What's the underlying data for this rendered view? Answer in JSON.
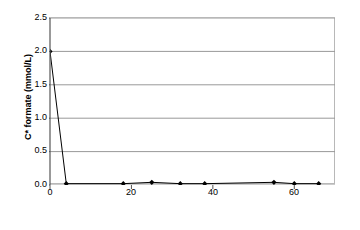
{
  "chart_data": {
    "type": "line",
    "title": "",
    "xlabel": "Elapsed time, t* (days)",
    "ylabel": "C* formate (mmol/L)",
    "xlim": [
      0,
      70
    ],
    "ylim": [
      0.0,
      2.5
    ],
    "xticks": [
      0,
      20,
      40,
      60
    ],
    "xticklabels": [
      "0",
      "20",
      "40",
      "60"
    ],
    "yticks": [
      0.0,
      0.5,
      1.0,
      1.5,
      2.0,
      2.5
    ],
    "yticklabels": [
      "0.0",
      "0.5",
      "1.0",
      "1.5",
      "2.0",
      "2.5"
    ],
    "grid": "horizontal",
    "grid_color": "#999999",
    "legend": "none",
    "marker": "filled-diamond",
    "marker_color": "#000000",
    "line_color": "#000000",
    "series": [
      {
        "name": "C* formate",
        "x": [
          0,
          4,
          18,
          25,
          32,
          38,
          55,
          60,
          66
        ],
        "y": [
          2.0,
          0.02,
          0.02,
          0.04,
          0.02,
          0.02,
          0.04,
          0.02,
          0.02
        ]
      }
    ]
  },
  "axes": {
    "ylabel": "C* formate (mmol/L)",
    "xlabel": "Elapsed time, t* (days)"
  }
}
